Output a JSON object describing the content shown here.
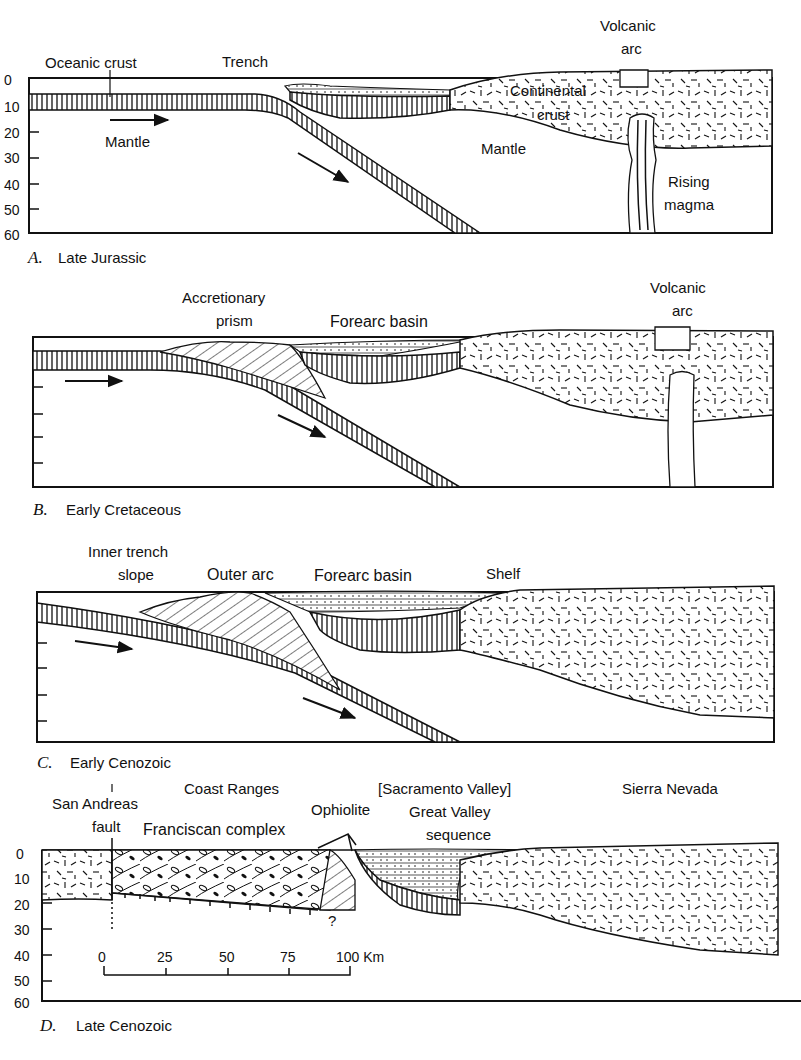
{
  "panels": [
    {
      "id": "A",
      "caption_letter": "A.",
      "caption_text": "Late Jurassic",
      "depth_ticks": [
        "0",
        "10",
        "20",
        "30",
        "40",
        "50",
        "60"
      ],
      "labels": {
        "oceanic_crust": "Oceanic crust",
        "trench": "Trench",
        "mantle_left": "Mantle",
        "continental_crust_1": "Continental",
        "continental_crust_2": "crust",
        "mantle_right": "Mantle",
        "volcanic_arc_1": "Volcanic",
        "volcanic_arc_2": "arc",
        "rising_magma_1": "Rising",
        "rising_magma_2": "magma"
      }
    },
    {
      "id": "B",
      "caption_letter": "B.",
      "caption_text": "Early Cretaceous",
      "labels": {
        "accretionary_prism_1": "Accretionary",
        "accretionary_prism_2": "prism",
        "forearc_basin": "Forearc basin",
        "volcanic_arc_1": "Volcanic",
        "volcanic_arc_2": "arc"
      }
    },
    {
      "id": "C",
      "caption_letter": "C.",
      "caption_text": "Early Cenozoic",
      "labels": {
        "inner_trench_slope_1": "Inner trench",
        "inner_trench_slope_2": "slope",
        "outer_arc": "Outer arc",
        "forearc_basin": "Forearc basin",
        "shelf": "Shelf"
      }
    },
    {
      "id": "D",
      "caption_letter": "D.",
      "caption_text": "Late Cenozoic",
      "depth_ticks": [
        "0",
        "10",
        "20",
        "30",
        "40",
        "50",
        "60"
      ],
      "labels": {
        "san_andreas_1": "San Andreas",
        "san_andreas_2": "fault",
        "coast_ranges": "Coast Ranges",
        "franciscan_complex": "Franciscan complex",
        "ophiolite": "Ophiolite",
        "sacramento_valley": "[Sacramento Valley]",
        "great_valley_1": "Great Valley",
        "great_valley_2": "sequence",
        "sierra_nevada": "Sierra Nevada",
        "question_mark": "?"
      },
      "scale_bar": {
        "ticks": [
          "0",
          "25",
          "50",
          "75",
          "100 Km"
        ]
      }
    }
  ]
}
